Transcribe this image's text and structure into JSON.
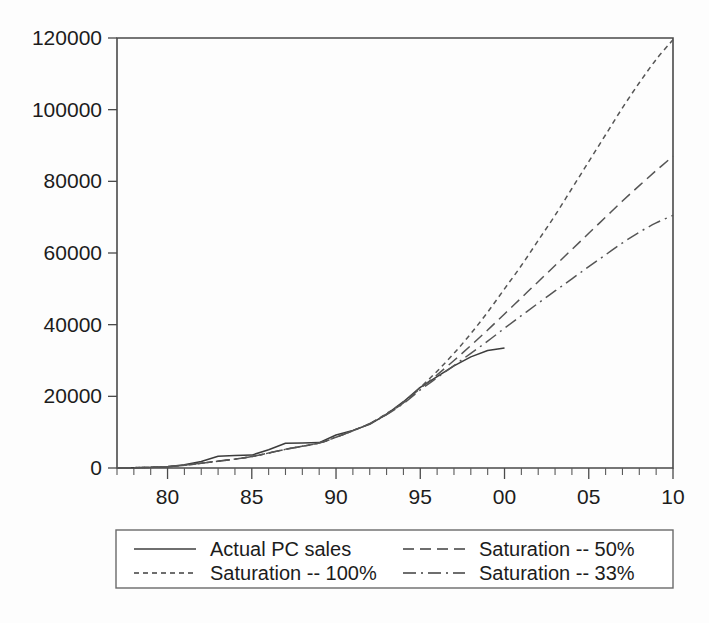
{
  "chart_data": {
    "type": "line",
    "title": "",
    "subtitle": "",
    "xlabel": "",
    "ylabel": "",
    "xlim": [
      77,
      110
    ],
    "ylim": [
      0,
      120000
    ],
    "grid": false,
    "legend_position": "bottom",
    "x_tick_labels": [
      "80",
      "85",
      "90",
      "95",
      "00",
      "05",
      "10"
    ],
    "x_tick_values": [
      80,
      85,
      90,
      95,
      100,
      105,
      110
    ],
    "x_minor_tick_step": 1,
    "y_tick_labels": [
      "0",
      "20000",
      "40000",
      "60000",
      "80000",
      "100000",
      "120000"
    ],
    "y_tick_values": [
      0,
      20000,
      40000,
      60000,
      80000,
      100000,
      120000
    ],
    "series": [
      {
        "name": "Actual PC sales",
        "style": "solid",
        "color": "#3c3c3c",
        "x": [
          77,
          78,
          79,
          80,
          81,
          82,
          83,
          84,
          85,
          86,
          87,
          88,
          89,
          90,
          91,
          92,
          93,
          94,
          95,
          96,
          97,
          98,
          99,
          100
        ],
        "values": [
          40,
          90,
          180,
          380,
          900,
          1800,
          3300,
          3500,
          3600,
          5100,
          6900,
          7000,
          7100,
          9200,
          10500,
          12200,
          15000,
          18500,
          22500,
          25500,
          28500,
          31000,
          32800,
          33500
        ]
      },
      {
        "name": "Saturation -- 100%",
        "style": "dashed-fine",
        "color": "#555555",
        "x": [
          77,
          80,
          83,
          85,
          87,
          89,
          90,
          91,
          92,
          93,
          94,
          95,
          96,
          97,
          98,
          99,
          100,
          101,
          102,
          103,
          104,
          105,
          106,
          107,
          108,
          109,
          110
        ],
        "values": [
          40,
          380,
          1900,
          3200,
          5200,
          7000,
          8600,
          10400,
          12400,
          15200,
          18400,
          22500,
          27000,
          32000,
          37500,
          43500,
          50000,
          56500,
          63500,
          70500,
          78000,
          85500,
          93000,
          100500,
          107500,
          114000,
          119500
        ]
      },
      {
        "name": "Saturation -- 50%",
        "style": "dashed-long",
        "color": "#555555",
        "x": [
          77,
          80,
          83,
          85,
          87,
          89,
          90,
          91,
          92,
          93,
          94,
          95,
          96,
          97,
          98,
          99,
          100,
          101,
          102,
          103,
          104,
          105,
          106,
          107,
          108,
          109,
          110
        ],
        "values": [
          40,
          380,
          1900,
          3200,
          5200,
          7000,
          8600,
          10400,
          12400,
          15000,
          18200,
          22200,
          26000,
          30000,
          34200,
          38500,
          43000,
          47500,
          52000,
          56500,
          61000,
          65500,
          70000,
          74500,
          78800,
          83000,
          87000
        ]
      },
      {
        "name": "Saturation -- 33%",
        "style": "dash-dot",
        "color": "#555555",
        "x": [
          77,
          80,
          83,
          85,
          87,
          89,
          90,
          91,
          92,
          93,
          94,
          95,
          96,
          97,
          98,
          99,
          100,
          101,
          102,
          103,
          104,
          105,
          106,
          107,
          108,
          109,
          110
        ],
        "values": [
          40,
          380,
          1900,
          3200,
          5200,
          7000,
          8600,
          10400,
          12400,
          14900,
          18000,
          21800,
          25200,
          28600,
          32000,
          35400,
          39000,
          42500,
          46000,
          49400,
          52800,
          56200,
          59500,
          62800,
          65800,
          68400,
          70500
        ]
      }
    ],
    "legend_entries": [
      {
        "label": "Actual PC sales",
        "style": "solid"
      },
      {
        "label": "Saturation -- 50%",
        "style": "dashed-long"
      },
      {
        "label": "Saturation -- 100%",
        "style": "dashed-fine"
      },
      {
        "label": "Saturation -- 33%",
        "style": "dash-dot"
      }
    ]
  },
  "colors": {
    "axis": "#4a4a4a",
    "text": "#1c1c1c",
    "background": "#fdfdfd",
    "legend_border": "#6a6a6a"
  }
}
